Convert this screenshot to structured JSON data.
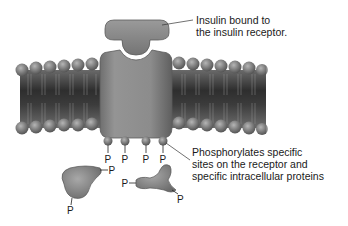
{
  "diagram": {
    "labels": {
      "insulin": {
        "line1": "Insulin bound to",
        "line2": "the insulin receptor."
      },
      "phosphorylation": {
        "line1": "Phosphorylates specific",
        "line2": "sites on the receptor and",
        "line3": "specific intracellular proteins"
      }
    },
    "phosphate_symbol": "P",
    "receptor_phosphates": [
      "P",
      "P",
      "P",
      "P"
    ],
    "protein1_phosphates": [
      "P",
      "P"
    ],
    "protein2_phosphates": [
      "P",
      "P"
    ],
    "components": [
      "insulin",
      "insulin-receptor",
      "lipid-bilayer",
      "phosphate-groups",
      "intracellular-proteins"
    ],
    "colors": {
      "background": "#ffffff",
      "protein_gray": "#8a8a8a",
      "membrane_dark": "#3a3a3a",
      "head_gray": "#7a7a7a",
      "text": "#1a1a1a"
    }
  }
}
